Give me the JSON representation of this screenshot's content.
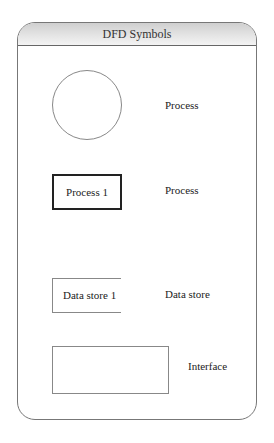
{
  "header": {
    "title": "DFD Symbols"
  },
  "symbols": [
    {
      "shape": "circle",
      "inner_text": "",
      "label": "Process"
    },
    {
      "shape": "rectangle-bold",
      "inner_text": "Process 1",
      "label": "Process"
    },
    {
      "shape": "open-rectangle",
      "inner_text": "Data store 1",
      "label": "Data store"
    },
    {
      "shape": "rectangle",
      "inner_text": "",
      "label": "Interface"
    }
  ],
  "colors": {
    "header_gradient_top": "#cfcfcf",
    "header_gradient_bottom": "#f3f3f3",
    "border": "#777777",
    "bold_border": "#222222"
  }
}
